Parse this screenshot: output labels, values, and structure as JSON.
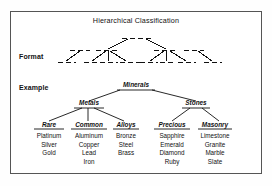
{
  "figure": {
    "title": "Hierarchical Classification",
    "row_labels": {
      "format": "Format",
      "example": "Example"
    }
  },
  "chart_data": {
    "type": "diagram",
    "title": "Hierarchical Classification",
    "format_tree": {
      "style": "dashed placeholder nodes, solid connector lines",
      "depth": 3,
      "root_children": 2,
      "branch_children": [
        3,
        3
      ]
    },
    "example_tree": {
      "root": "Minerals",
      "children": [
        {
          "name": "Metals",
          "children": [
            {
              "name": "Rare",
              "items": [
                "Platinum",
                "Silver",
                "Gold"
              ]
            },
            {
              "name": "Common",
              "items": [
                "Aluminum",
                "Copper",
                "Lead",
                "Iron"
              ]
            },
            {
              "name": "Alloys",
              "items": [
                "Bronze",
                "Steel",
                "Brass"
              ]
            }
          ]
        },
        {
          "name": "Stones",
          "children": [
            {
              "name": "Precious",
              "items": [
                "Sapphire",
                "Emerald",
                "Diamond",
                "Ruby"
              ]
            },
            {
              "name": "Masonry",
              "items": [
                "Limestone",
                "Granite",
                "Marble",
                "Slate"
              ]
            }
          ]
        }
      ]
    }
  },
  "nodes": {
    "minerals": "Minerals",
    "metals": "Metals",
    "stones": "Stones",
    "rare": "Rare",
    "common": "Common",
    "alloys": "Alloys",
    "precious": "Precious",
    "masonry": "Masonry"
  },
  "leaves": {
    "rare": "Platinum\nSilver\nGold",
    "common": "Aluminum\nCopper\nLead\nIron",
    "alloys": "Bronze\nSteel\nBrass",
    "precious": "Sapphire\nEmerald\nDiamond\nRuby",
    "masonry": "Limestone\nGranite\nMarble\nSlate"
  },
  "colors": {
    "ink": "#111111",
    "border": "#555555",
    "background": "#ffffff"
  }
}
